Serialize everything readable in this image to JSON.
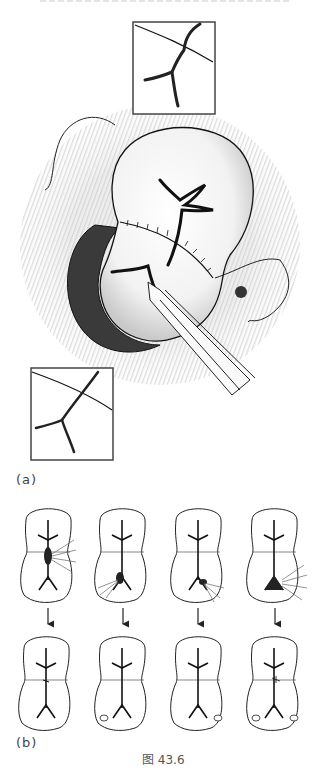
{
  "figure": {
    "caption": "图 43.6",
    "panels": [
      {
        "label": "(a)",
        "description": "kidney repair with sutured incision, drainage tube and two magnified insets"
      },
      {
        "label": "(b)",
        "description": "four kidney sketches with calyceal injury (top) and repaired state (bottom) connected by arrows"
      }
    ],
    "insets": [
      "top-inset",
      "bottom-left-inset"
    ],
    "series_b": {
      "columns": 4,
      "rows": [
        "before",
        "after"
      ]
    }
  },
  "colors": {
    "line": "#222222",
    "shade": "#bdbdbd",
    "background": "#ffffff"
  }
}
